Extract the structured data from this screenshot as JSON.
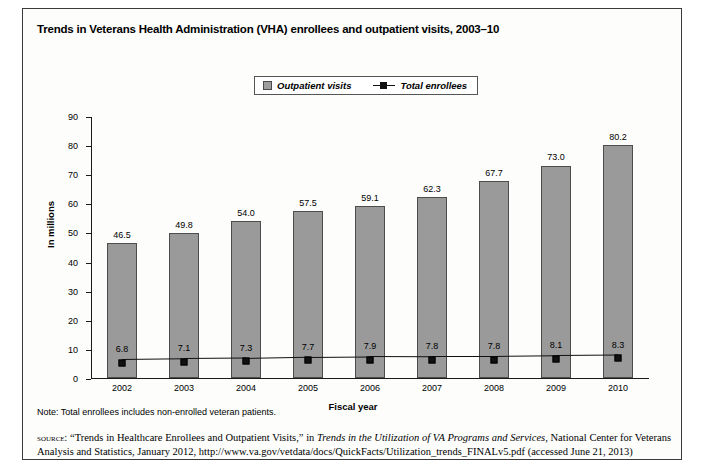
{
  "figure": {
    "title": "Trends in Veterans Health Administration (VHA) enrollees and outpatient visits, 2003–10",
    "note": "Note: Total enrollees includes non-enrolled veteran patients.",
    "source_keyword": "source:",
    "source_part1": " “Trends in Healthcare Enrollees and Outpatient Visits,” in ",
    "source_italic1": "Trends in the Utilization of VA Programs and Services",
    "source_part2": ", National Center for Veterans Analysis and Statistics, January 2012, http://www.va.gov/vetdata/docs/QuickFacts/Utilization_trends_FINALv5.pdf (accessed June 21, 2013)"
  },
  "chart_data": {
    "type": "bar",
    "title": "Trends in Veterans Health Administration (VHA) enrollees and outpatient visits, 2003–10",
    "xlabel": "Fiscal year",
    "ylabel": "In millions",
    "ylim": [
      0,
      90
    ],
    "ytick_step": 10,
    "yticks": [
      0,
      10,
      20,
      30,
      40,
      50,
      60,
      70,
      80,
      90
    ],
    "grid": false,
    "legend_position": "top-center",
    "categories": [
      "2002",
      "2003",
      "2004",
      "2005",
      "2006",
      "2007",
      "2008",
      "2009",
      "2010"
    ],
    "series": [
      {
        "name": "Outpatient visits",
        "type": "bar",
        "color": "#9a9a9a",
        "values": [
          46.5,
          49.8,
          54.0,
          57.5,
          59.1,
          62.3,
          67.7,
          73.0,
          80.2
        ],
        "labels": [
          "46.5",
          "49.8",
          "54.0",
          "57.5",
          "59.1",
          "62.3",
          "67.7",
          "73.0",
          "80.2"
        ]
      },
      {
        "name": "Total enrollees",
        "type": "line",
        "color": "#111111",
        "values": [
          6.8,
          7.1,
          7.3,
          7.7,
          7.9,
          7.8,
          7.8,
          8.1,
          8.3
        ],
        "labels": [
          "6.8",
          "7.1",
          "7.3",
          "7.7",
          "7.9",
          "7.8",
          "7.8",
          "8.1",
          "8.3"
        ]
      }
    ]
  },
  "legend": {
    "items": [
      {
        "label": "Outpatient visits",
        "marker": "filled-square"
      },
      {
        "label": "Total enrollees",
        "marker": "line-with-square"
      }
    ]
  }
}
